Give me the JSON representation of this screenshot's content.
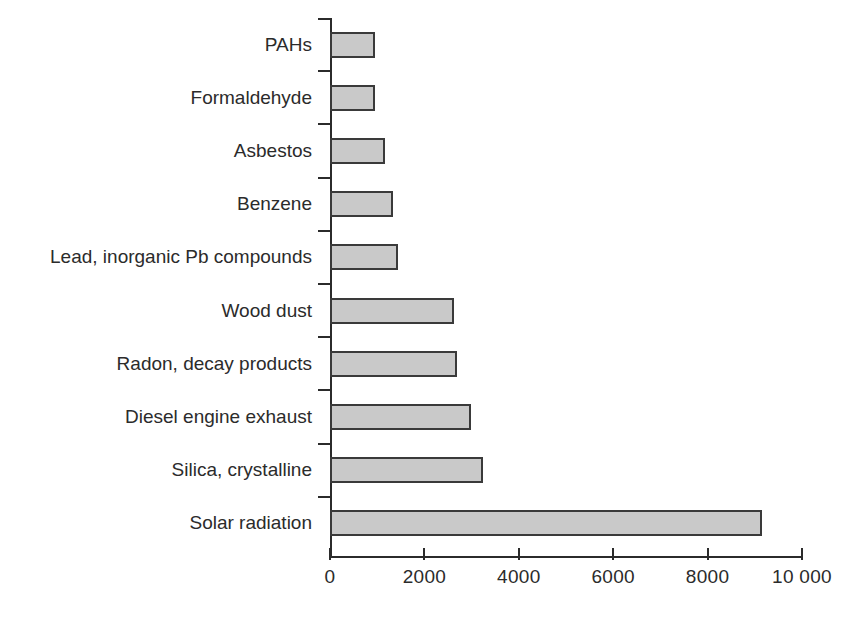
{
  "chart_data": {
    "type": "bar",
    "orientation": "horizontal",
    "title": "",
    "subtitle": "",
    "xlabel": "",
    "ylabel": "",
    "xlim": [
      0,
      10000
    ],
    "grid": false,
    "legend": null,
    "bar_fill_color": "#c9c9c9",
    "bar_border_color": "#3a3a3a",
    "axis_color": "#2b2b2b",
    "xticks": [
      0,
      2000,
      4000,
      6000,
      8000,
      10000
    ],
    "xtick_labels": [
      "0",
      "2000",
      "4000",
      "6000",
      "8000",
      "10 000"
    ],
    "categories": [
      "PAHs",
      "Formaldehyde",
      "Asbestos",
      "Benzene",
      "Lead, inorganic Pb compounds",
      "Wood dust",
      "Radon, decay products",
      "Diesel engine exhaust",
      "Silica, crystalline",
      "Solar radiation"
    ],
    "values": [
      950,
      950,
      1170,
      1330,
      1440,
      2630,
      2690,
      2990,
      3240,
      9150
    ]
  }
}
